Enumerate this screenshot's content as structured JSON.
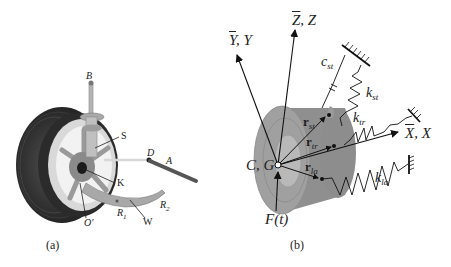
{
  "panel_a": {
    "caption": "(a)",
    "labels": {
      "B": "B",
      "S": "S",
      "D": "D",
      "A": "A",
      "K": "K",
      "R1_main": "R",
      "R1_sub": "1",
      "R2_main": "R",
      "R2_sub": "2",
      "W": "W",
      "O": "O'"
    }
  },
  "panel_b": {
    "caption": "(b)",
    "axes": {
      "y_bar": "Y",
      "y": ", Y",
      "z_bar": "Z",
      "z": ", Z",
      "x_bar": "X",
      "x": ", X"
    },
    "origin_label": "C, G",
    "force_label": "F(t)",
    "damper": {
      "main": "c",
      "sub": "st"
    },
    "springs": [
      {
        "main": "k",
        "sub": "st"
      },
      {
        "main": "k",
        "sub": "tr"
      },
      {
        "main": "k",
        "sub": "la"
      }
    ],
    "vectors": [
      {
        "main": "r",
        "sub": "st"
      },
      {
        "main": "r",
        "sub": "tr"
      },
      {
        "main": "r",
        "sub": "la"
      }
    ]
  }
}
